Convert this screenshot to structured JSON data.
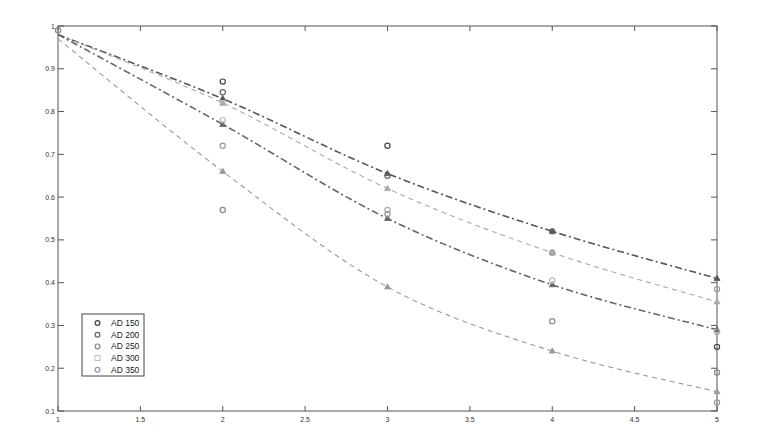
{
  "chart_data": {
    "type": "scatter",
    "title": "",
    "xlabel": "",
    "ylabel": "",
    "xlim": [
      1,
      5
    ],
    "ylim": [
      0.1,
      1.0
    ],
    "grid": false,
    "legend_position": "lower left",
    "x_ticks": [
      1,
      1.5,
      2,
      2.5,
      3,
      3.5,
      4,
      4.5,
      5
    ],
    "x_tick_labels": [
      "1",
      "1.5",
      "2",
      "2.5",
      "3",
      "3.5",
      "4",
      "4.5",
      "5"
    ],
    "y_ticks": [
      0.1,
      0.2,
      0.3,
      0.4,
      0.5,
      0.6,
      0.7,
      0.8,
      0.9,
      1.0
    ],
    "y_tick_labels": [
      "0.1",
      "0.2",
      "0.3",
      "0.4",
      "0.5",
      "0.6",
      "0.7",
      "0.8",
      "0.9",
      "1"
    ],
    "legend": [
      {
        "label": "AD 150",
        "marker": "circle",
        "color": "#444444"
      },
      {
        "label": "AD 200",
        "marker": "circle",
        "color": "#666666"
      },
      {
        "label": "AD 250",
        "marker": "circle",
        "color": "#888888"
      },
      {
        "label": "AD 300",
        "marker": "square",
        "color": "#bbbbbb"
      },
      {
        "label": "AD 350",
        "marker": "circle",
        "color": "#999999"
      }
    ],
    "scatter_points": [
      {
        "x": 1,
        "y": 0.99,
        "marker": "circle",
        "color": "#888888"
      },
      {
        "x": 2,
        "y": 0.87,
        "marker": "circle",
        "color": "#444444"
      },
      {
        "x": 2,
        "y": 0.845,
        "marker": "circle",
        "color": "#666666"
      },
      {
        "x": 2,
        "y": 0.82,
        "marker": "square",
        "color": "#bbbbbb"
      },
      {
        "x": 2,
        "y": 0.78,
        "marker": "circle",
        "color": "#bbbbbb"
      },
      {
        "x": 2,
        "y": 0.72,
        "marker": "circle",
        "color": "#999999"
      },
      {
        "x": 2,
        "y": 0.57,
        "marker": "circle",
        "color": "#888888"
      },
      {
        "x": 3,
        "y": 0.72,
        "marker": "circle",
        "color": "#444444"
      },
      {
        "x": 3,
        "y": 0.65,
        "marker": "circle",
        "color": "#666666"
      },
      {
        "x": 3,
        "y": 0.57,
        "marker": "circle",
        "color": "#aaaaaa"
      },
      {
        "x": 3,
        "y": 0.56,
        "marker": "circle",
        "color": "#999999"
      },
      {
        "x": 4,
        "y": 0.52,
        "marker": "circle",
        "color": "#666666"
      },
      {
        "x": 4,
        "y": 0.47,
        "marker": "circle",
        "color": "#999999"
      },
      {
        "x": 4,
        "y": 0.405,
        "marker": "circle",
        "color": "#bbbbbb"
      },
      {
        "x": 4,
        "y": 0.31,
        "marker": "circle",
        "color": "#888888"
      },
      {
        "x": 5,
        "y": 0.385,
        "marker": "circle",
        "color": "#999999"
      },
      {
        "x": 5,
        "y": 0.285,
        "marker": "circle",
        "color": "#aaaaaa"
      },
      {
        "x": 5,
        "y": 0.25,
        "marker": "circle",
        "color": "#444444"
      },
      {
        "x": 5,
        "y": 0.19,
        "marker": "circle",
        "color": "#888888"
      },
      {
        "x": 5,
        "y": 0.12,
        "marker": "circle",
        "color": "#999999"
      }
    ],
    "series": [
      {
        "name": "fit-1",
        "style": "dash-dot",
        "color": "#555555",
        "marker": "triangle",
        "x": [
          1,
          2,
          3,
          4,
          5
        ],
        "values": [
          0.98,
          0.83,
          0.655,
          0.52,
          0.41
        ]
      },
      {
        "name": "fit-2",
        "style": "dashed",
        "color": "#aaaaaa",
        "marker": "triangle",
        "x": [
          1,
          2,
          3,
          4,
          5
        ],
        "values": [
          0.98,
          0.82,
          0.62,
          0.47,
          0.355
        ]
      },
      {
        "name": "fit-3",
        "style": "dash-dot",
        "color": "#666666",
        "marker": "triangle",
        "x": [
          1,
          2,
          3,
          4,
          5
        ],
        "values": [
          0.98,
          0.77,
          0.55,
          0.395,
          0.29
        ]
      },
      {
        "name": "fit-4",
        "style": "dashed",
        "color": "#999999",
        "marker": "triangle",
        "x": [
          1,
          2,
          3,
          4,
          5
        ],
        "values": [
          0.97,
          0.66,
          0.39,
          0.24,
          0.145
        ]
      }
    ]
  }
}
